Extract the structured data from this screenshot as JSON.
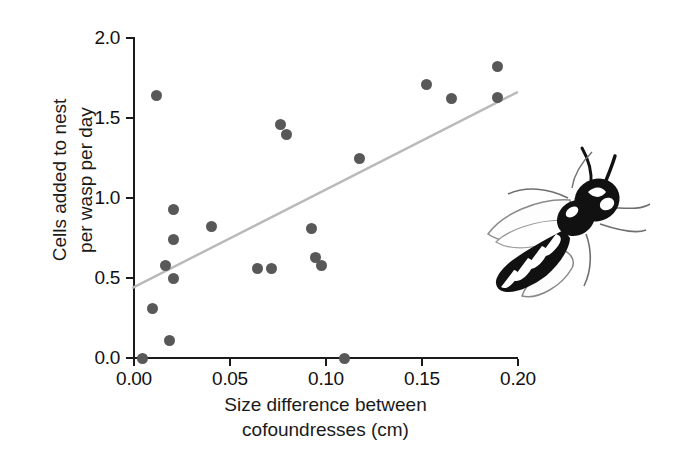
{
  "figure": {
    "background_color": "#ffffff",
    "axis_color": "#1b1b1b",
    "point_color": "#585858",
    "trendline_color": "#b9b9b9"
  },
  "axes": {
    "y": {
      "label_line1": "Cells added to nest",
      "label_line2": "per wasp per day",
      "ticks": [
        "0.0",
        "0.5",
        "1.0",
        "1.5",
        "2.0"
      ]
    },
    "x": {
      "label_line1": "Size difference between",
      "label_line2": "cofoundresses (cm)",
      "ticks": [
        "0.00",
        "0.05",
        "0.10",
        "0.15",
        "0.20"
      ]
    }
  },
  "illustration": {
    "name": "paper-wasp-illustration",
    "caption": ""
  },
  "chart_data": {
    "type": "scatter",
    "title": "",
    "xlabel": "Size difference between cofoundresses (cm)",
    "ylabel": "Cells added to nest per wasp per day",
    "xlim": [
      0.0,
      0.2
    ],
    "ylim": [
      0.0,
      2.0
    ],
    "xticks": [
      0.0,
      0.05,
      0.1,
      0.15,
      0.2
    ],
    "yticks": [
      0.0,
      0.5,
      1.0,
      1.5,
      2.0
    ],
    "grid": false,
    "legend": null,
    "points": [
      {
        "x": 0.005,
        "y": 0.0
      },
      {
        "x": 0.01,
        "y": 0.31
      },
      {
        "x": 0.012,
        "y": 1.64
      },
      {
        "x": 0.019,
        "y": 0.11
      },
      {
        "x": 0.021,
        "y": 0.5
      },
      {
        "x": 0.017,
        "y": 0.58
      },
      {
        "x": 0.021,
        "y": 0.74
      },
      {
        "x": 0.021,
        "y": 0.93
      },
      {
        "x": 0.041,
        "y": 0.82
      },
      {
        "x": 0.065,
        "y": 0.56
      },
      {
        "x": 0.072,
        "y": 0.56
      },
      {
        "x": 0.077,
        "y": 1.46
      },
      {
        "x": 0.08,
        "y": 1.4
      },
      {
        "x": 0.093,
        "y": 0.81
      },
      {
        "x": 0.095,
        "y": 0.63
      },
      {
        "x": 0.098,
        "y": 0.58
      },
      {
        "x": 0.11,
        "y": 0.0
      },
      {
        "x": 0.118,
        "y": 1.25
      },
      {
        "x": 0.153,
        "y": 1.71
      },
      {
        "x": 0.166,
        "y": 1.62
      },
      {
        "x": 0.19,
        "y": 1.82
      },
      {
        "x": 0.19,
        "y": 1.63
      }
    ],
    "trendline": {
      "type": "linear-fit",
      "x_start": 0.0,
      "y_start": 0.44,
      "x_end": 0.2,
      "y_end": 1.66
    }
  }
}
